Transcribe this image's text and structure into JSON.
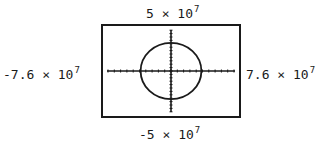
{
  "chart_data": {
    "type": "line",
    "title": "",
    "xlabel": "",
    "ylabel": "",
    "xlim": [
      -76000000,
      76000000
    ],
    "ylim": [
      -50000000,
      50000000
    ],
    "window_labels": {
      "ymax": {
        "mant": "5",
        "exp": "7"
      },
      "ymin": {
        "mant": "-5",
        "exp": "7"
      },
      "xmin": {
        "mant": "-7.6",
        "exp": "7"
      },
      "xmax": {
        "mant": "7.6",
        "exp": "7"
      }
    },
    "grid": false,
    "axes_visible": true,
    "tick_marks": true,
    "series": [
      {
        "name": "circle",
        "shape": "circle",
        "center": [
          0,
          0
        ],
        "radius_x": 33000000,
        "radius_y": 30000000,
        "color": "#1a1a1a"
      }
    ]
  },
  "labels": {
    "times": "×",
    "base": "10"
  }
}
